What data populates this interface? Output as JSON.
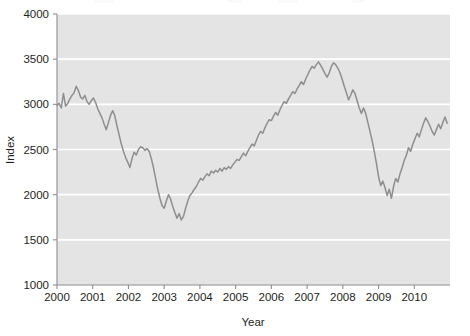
{
  "chart_data": {
    "type": "line",
    "title": "",
    "subtitle": "",
    "xlabel": "Year",
    "ylabel": "Index",
    "xlim": [
      2000,
      2011
    ],
    "ylim": [
      1000,
      4000
    ],
    "yticks": [
      1000,
      1500,
      2000,
      2500,
      3000,
      3500,
      4000
    ],
    "ytick_labels": [
      "1000",
      "1500",
      "2000",
      "2500",
      "3000",
      "3500",
      "4000"
    ],
    "xticks": [
      2000,
      2001,
      2002,
      2003,
      2004,
      2005,
      2006,
      2007,
      2008,
      2009,
      2010
    ],
    "xtick_labels": [
      "2000",
      "2001",
      "2002",
      "2003",
      "2004",
      "2005",
      "2006",
      "2007",
      "2008",
      "2009",
      "2010"
    ],
    "grid": "horizontal-white-on-gray-panel",
    "legend": "none",
    "panel_color": "#e4e4e4",
    "line_color": "#8e8e8e",
    "series": [
      {
        "name": "Index",
        "x": [
          2000.0,
          2000.06,
          2000.12,
          2000.18,
          2000.24,
          2000.3,
          2000.36,
          2000.42,
          2000.48,
          2000.54,
          2000.6,
          2000.66,
          2000.72,
          2000.78,
          2000.84,
          2000.9,
          2000.96,
          2001.02,
          2001.08,
          2001.14,
          2001.2,
          2001.26,
          2001.32,
          2001.38,
          2001.44,
          2001.5,
          2001.56,
          2001.62,
          2001.68,
          2001.74,
          2001.8,
          2001.86,
          2001.92,
          2001.98,
          2002.04,
          2002.1,
          2002.16,
          2002.22,
          2002.28,
          2002.34,
          2002.4,
          2002.46,
          2002.52,
          2002.58,
          2002.64,
          2002.7,
          2002.76,
          2002.82,
          2002.88,
          2002.94,
          2003.0,
          2003.06,
          2003.12,
          2003.18,
          2003.24,
          2003.3,
          2003.36,
          2003.42,
          2003.48,
          2003.54,
          2003.6,
          2003.66,
          2003.72,
          2003.78,
          2003.84,
          2003.9,
          2003.96,
          2004.02,
          2004.08,
          2004.14,
          2004.2,
          2004.26,
          2004.32,
          2004.38,
          2004.44,
          2004.5,
          2004.56,
          2004.62,
          2004.68,
          2004.74,
          2004.8,
          2004.86,
          2004.92,
          2004.98,
          2005.04,
          2005.1,
          2005.16,
          2005.22,
          2005.28,
          2005.34,
          2005.4,
          2005.46,
          2005.52,
          2005.58,
          2005.64,
          2005.7,
          2005.76,
          2005.82,
          2005.88,
          2005.94,
          2006.0,
          2006.06,
          2006.12,
          2006.18,
          2006.24,
          2006.3,
          2006.36,
          2006.42,
          2006.48,
          2006.54,
          2006.6,
          2006.66,
          2006.72,
          2006.78,
          2006.84,
          2006.9,
          2006.96,
          2007.02,
          2007.08,
          2007.14,
          2007.2,
          2007.26,
          2007.32,
          2007.38,
          2007.44,
          2007.5,
          2007.56,
          2007.62,
          2007.68,
          2007.74,
          2007.8,
          2007.86,
          2007.92,
          2007.98,
          2008.04,
          2008.1,
          2008.16,
          2008.22,
          2008.28,
          2008.34,
          2008.4,
          2008.46,
          2008.52,
          2008.58,
          2008.64,
          2008.7,
          2008.76,
          2008.82,
          2008.88,
          2008.94,
          2009.0,
          2009.06,
          2009.12,
          2009.18,
          2009.24,
          2009.3,
          2009.36,
          2009.42,
          2009.48,
          2009.54,
          2009.6,
          2009.66,
          2009.72,
          2009.78,
          2009.84,
          2009.9,
          2009.96,
          2010.02,
          2010.08,
          2010.14,
          2010.2,
          2010.26,
          2010.32,
          2010.38,
          2010.44,
          2010.5,
          2010.56,
          2010.62,
          2010.68,
          2010.74,
          2010.8,
          2010.86,
          2010.92
        ],
        "values": [
          2990,
          3010,
          2960,
          3120,
          2980,
          3010,
          3060,
          3100,
          3130,
          3200,
          3150,
          3080,
          3060,
          3100,
          3030,
          3000,
          3040,
          3070,
          3020,
          2950,
          2900,
          2850,
          2780,
          2720,
          2800,
          2880,
          2930,
          2870,
          2760,
          2660,
          2560,
          2480,
          2410,
          2360,
          2300,
          2400,
          2470,
          2440,
          2500,
          2530,
          2520,
          2490,
          2510,
          2480,
          2400,
          2300,
          2180,
          2060,
          1960,
          1880,
          1850,
          1930,
          2000,
          1950,
          1870,
          1800,
          1740,
          1790,
          1720,
          1760,
          1850,
          1930,
          1990,
          2020,
          2060,
          2090,
          2140,
          2180,
          2160,
          2200,
          2230,
          2210,
          2260,
          2240,
          2270,
          2250,
          2290,
          2260,
          2300,
          2280,
          2310,
          2290,
          2330,
          2360,
          2390,
          2380,
          2420,
          2460,
          2430,
          2480,
          2520,
          2560,
          2540,
          2600,
          2660,
          2700,
          2680,
          2740,
          2790,
          2830,
          2820,
          2870,
          2910,
          2880,
          2940,
          2990,
          3030,
          3010,
          3060,
          3100,
          3140,
          3120,
          3170,
          3210,
          3250,
          3220,
          3280,
          3330,
          3380,
          3420,
          3400,
          3440,
          3470,
          3430,
          3390,
          3340,
          3300,
          3350,
          3420,
          3460,
          3440,
          3400,
          3350,
          3280,
          3200,
          3130,
          3050,
          3100,
          3160,
          3120,
          3040,
          2960,
          2900,
          2960,
          2900,
          2800,
          2700,
          2600,
          2480,
          2350,
          2200,
          2100,
          2150,
          2080,
          1990,
          2060,
          1960,
          2090,
          2180,
          2140,
          2230,
          2300,
          2380,
          2440,
          2520,
          2480,
          2560,
          2620,
          2680,
          2640,
          2720,
          2790,
          2850,
          2810,
          2760,
          2700,
          2660,
          2720,
          2780,
          2730,
          2800,
          2860,
          2790
        ]
      }
    ]
  },
  "axes": {
    "y_title": "Index",
    "x_title": "Year"
  }
}
